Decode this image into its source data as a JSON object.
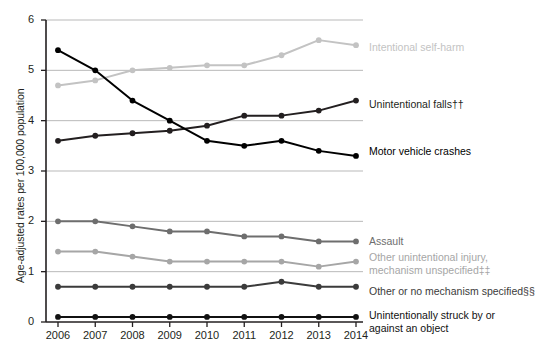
{
  "chart_data": {
    "type": "line",
    "title": "",
    "xlabel": "",
    "ylabel": "Age-adjusted rates per 100,000 population",
    "categories": [
      "2006",
      "2007",
      "2008",
      "2009",
      "2010",
      "2011",
      "2012",
      "2013",
      "2014"
    ],
    "x": [
      2006,
      2007,
      2008,
      2009,
      2010,
      2011,
      2012,
      2013,
      2014
    ],
    "xlim": [
      2006,
      2014
    ],
    "ylim": [
      0,
      6
    ],
    "y_ticks": [
      "0",
      "1",
      "2",
      "3",
      "4",
      "5",
      "6"
    ],
    "grid": "horizontal",
    "legend_position": "right-inline-at-line-end",
    "series": [
      {
        "name": "Intentional self-harm",
        "label": "Intentional self-harm",
        "color": "#c3c3c3",
        "values": [
          4.7,
          4.8,
          5.0,
          5.05,
          5.1,
          5.1,
          5.3,
          5.6,
          5.5
        ],
        "label_y": 48
      },
      {
        "name": "Unintentional falls",
        "label": "Unintentional falls††",
        "color": "#231f20",
        "values": [
          3.6,
          3.7,
          3.75,
          3.8,
          3.9,
          4.1,
          4.1,
          4.2,
          4.4
        ],
        "label_y": 105
      },
      {
        "name": "Motor vehicle crashes",
        "label": "Motor vehicle crashes",
        "color": "#000000",
        "values": [
          5.4,
          5.0,
          4.4,
          4.0,
          3.6,
          3.5,
          3.6,
          3.4,
          3.3
        ],
        "label_y": 152
      },
      {
        "name": "Assault",
        "label": "Assault",
        "color": "#6e6e6e",
        "values": [
          2.0,
          2.0,
          1.9,
          1.8,
          1.8,
          1.7,
          1.7,
          1.6,
          1.6
        ],
        "label_y": 242
      },
      {
        "name": "Other unintentional injury, mechanism unspecified",
        "label": "Other unintentional injury,\nmechanism unspecified‡‡",
        "color": "#a6a6a6",
        "values": [
          1.4,
          1.4,
          1.3,
          1.2,
          1.2,
          1.2,
          1.2,
          1.1,
          1.2
        ],
        "label_y": 258
      },
      {
        "name": "Other or no mechanism specified",
        "label": "Other or no mechanism specified§§",
        "color": "#3b3b3b",
        "values": [
          0.7,
          0.7,
          0.7,
          0.7,
          0.7,
          0.7,
          0.8,
          0.7,
          0.7
        ],
        "label_y": 292
      },
      {
        "name": "Unintentionally struck by or against an object",
        "label": "Unintentionally struck by or\nagainst an object",
        "color": "#111111",
        "values": [
          0.1,
          0.1,
          0.1,
          0.1,
          0.1,
          0.1,
          0.1,
          0.1,
          0.1
        ],
        "label_y": 316
      }
    ]
  },
  "axis": {
    "y_title": "Age-adjusted rates per 100,000 population"
  }
}
